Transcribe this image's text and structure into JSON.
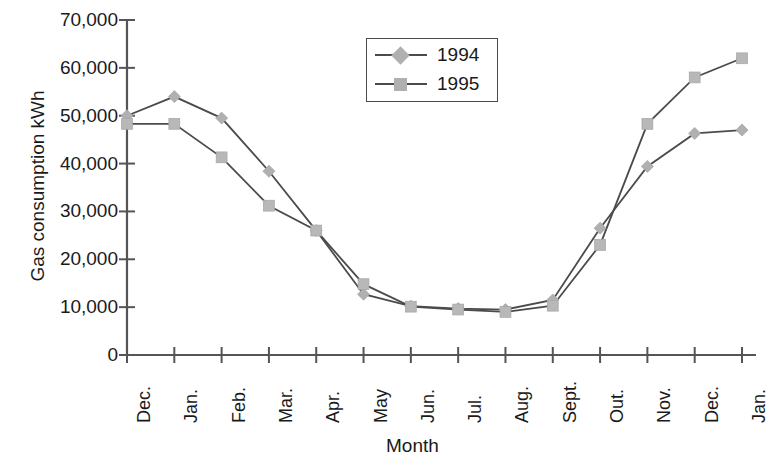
{
  "chart_data": {
    "type": "line",
    "title": "",
    "xlabel": "Month",
    "ylabel": "Gas consumption kWh",
    "categories": [
      "Dec.",
      "Jan.",
      "Feb.",
      "Mar.",
      "Apr.",
      "May",
      "Jun.",
      "Jul.",
      "Aug.",
      "Sept.",
      "Out.",
      "Nov.",
      "Dec.",
      "Jan."
    ],
    "ylim": [
      0,
      70000
    ],
    "ytick_labels": [
      "0",
      "10,000",
      "20,000",
      "30,000",
      "40,000",
      "50,000",
      "60,000",
      "70,000"
    ],
    "ytick_values": [
      0,
      10000,
      20000,
      30000,
      40000,
      50000,
      60000,
      70000
    ],
    "grid": false,
    "legend_position": "top-center",
    "series": [
      {
        "name": "1994",
        "marker": "diamond",
        "color": "#b0b0b0",
        "line_color": "#4b4b4b",
        "values": [
          50000,
          54000,
          49500,
          38400,
          26000,
          12700,
          10200,
          9700,
          9500,
          11500,
          26500,
          39400,
          46300,
          47000
        ]
      },
      {
        "name": "1995",
        "marker": "square",
        "color": "#b8b8b8",
        "line_color": "#4b4b4b",
        "values": [
          48300,
          48300,
          41300,
          31200,
          26000,
          14800,
          10100,
          9500,
          9000,
          10300,
          23000,
          48300,
          58000,
          62000
        ]
      }
    ]
  },
  "legend": {
    "items": [
      {
        "label": "1994"
      },
      {
        "label": "1995"
      }
    ]
  },
  "axes": {
    "y_title": "Gas consumption kWh",
    "x_title": "Month"
  }
}
